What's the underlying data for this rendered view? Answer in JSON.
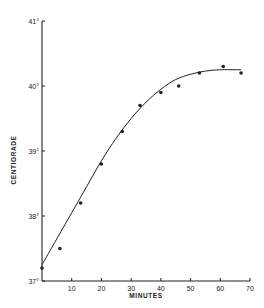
{
  "chart_data": {
    "type": "scatter",
    "title": "",
    "xlabel": "MINUTES",
    "ylabel": "CENTIGRADE",
    "xlim": [
      0,
      70
    ],
    "ylim": [
      37,
      41
    ],
    "x_ticks": [
      10,
      20,
      30,
      40,
      50,
      60,
      70
    ],
    "x_tick_labels": [
      "10",
      "20",
      "30",
      "40",
      "50",
      "60",
      "70"
    ],
    "y_ticks": [
      37,
      38,
      39,
      40,
      41
    ],
    "y_tick_labels": [
      "37°",
      "38°",
      "39°",
      "40°",
      "41°"
    ],
    "grid": false,
    "legend": null,
    "series": [
      {
        "name": "measured temperature",
        "kind": "points",
        "x": [
          0,
          6,
          13,
          20,
          27,
          33,
          40,
          46,
          53,
          61,
          67
        ],
        "y": [
          37.2,
          37.5,
          38.2,
          38.8,
          39.3,
          39.7,
          39.9,
          40.0,
          40.2,
          40.3,
          40.2
        ]
      },
      {
        "name": "fitted curve",
        "kind": "line",
        "x": [
          0,
          5,
          10,
          15,
          20,
          25,
          30,
          35,
          40,
          45,
          50,
          55,
          60,
          65,
          67
        ],
        "y": [
          37.25,
          37.65,
          38.05,
          38.45,
          38.85,
          39.2,
          39.5,
          39.75,
          39.95,
          40.1,
          40.18,
          40.23,
          40.25,
          40.25,
          40.25
        ]
      }
    ]
  },
  "colors": {
    "ink": "#222222",
    "background": "#ffffff"
  }
}
